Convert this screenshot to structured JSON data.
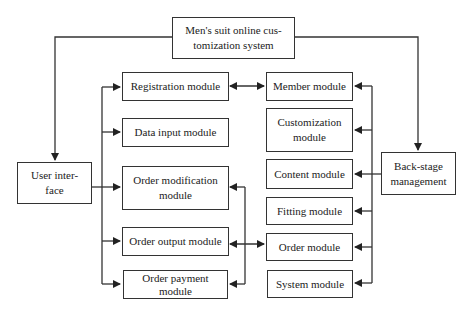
{
  "diagram": {
    "type": "system architecture block diagram",
    "root": {
      "id": "root",
      "label": "Men's suit online customization system",
      "line1": "Men's suit online cus-",
      "line2": "tomization system"
    },
    "left_branch": {
      "id": "user-interface",
      "line1": "User inter-",
      "line2": "face",
      "label": "User interface",
      "modules": [
        {
          "id": "registration",
          "label": "Registration module"
        },
        {
          "id": "data-input",
          "label": "Data input module"
        },
        {
          "id": "order-modification",
          "label": "Order modification module",
          "line1": "Order modification",
          "line2": "module"
        },
        {
          "id": "order-output",
          "label": "Order output module"
        },
        {
          "id": "order-payment",
          "label": "Order payment module",
          "line1": "Order payment",
          "line2": "module"
        }
      ]
    },
    "right_branch": {
      "id": "back-stage",
      "line1": "Back-stage",
      "line2": "management",
      "label": "Back-stage management",
      "modules": [
        {
          "id": "member",
          "label": "Member module"
        },
        {
          "id": "customization",
          "label": "Customization module",
          "line1": "Customization",
          "line2": "module"
        },
        {
          "id": "content",
          "label": "Content module"
        },
        {
          "id": "fitting",
          "label": "Fitting module"
        },
        {
          "id": "order",
          "label": "Order module"
        },
        {
          "id": "system",
          "label": "System module"
        }
      ]
    },
    "edges": [
      {
        "from": "root",
        "to": "user-interface",
        "type": "arrow"
      },
      {
        "from": "root",
        "to": "back-stage",
        "type": "arrow"
      },
      {
        "from": "user-interface",
        "to": [
          "registration",
          "data-input",
          "order-modification",
          "order-output",
          "order-payment"
        ],
        "type": "arrow"
      },
      {
        "from": "back-stage",
        "to": [
          "member",
          "customization",
          "content",
          "fitting",
          "order",
          "system"
        ],
        "type": "arrow"
      },
      {
        "from": "registration",
        "to": "member",
        "type": "bidirectional"
      },
      {
        "from": "order",
        "to": [
          "order-modification",
          "order-output",
          "order-payment"
        ],
        "type": "bidirectional"
      }
    ],
    "colors": {
      "line": "#333333",
      "box_fill": "#ffffff",
      "background": "#ffffff"
    }
  }
}
